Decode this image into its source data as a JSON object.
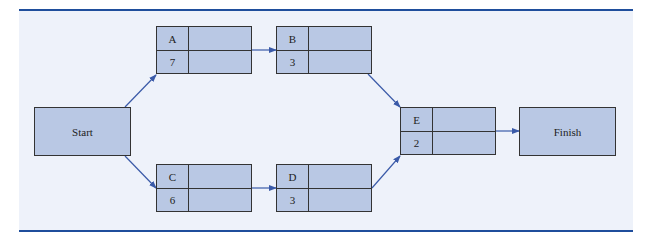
{
  "diagram": {
    "type": "activity-on-node network",
    "start_label": "Start",
    "finish_label": "Finish",
    "nodes": [
      {
        "id": "A",
        "duration": "7"
      },
      {
        "id": "B",
        "duration": "3"
      },
      {
        "id": "C",
        "duration": "6"
      },
      {
        "id": "D",
        "duration": "3"
      },
      {
        "id": "E",
        "duration": "2"
      }
    ],
    "edges": [
      [
        "Start",
        "A"
      ],
      [
        "Start",
        "C"
      ],
      [
        "A",
        "B"
      ],
      [
        "C",
        "D"
      ],
      [
        "B",
        "E"
      ],
      [
        "D",
        "E"
      ],
      [
        "E",
        "Finish"
      ]
    ],
    "colors": {
      "node_fill": "#b9c8e4",
      "border": "#333333",
      "arrow": "#3a5aa8",
      "rule": "#1f4e9c",
      "background": "#eef2fa"
    }
  }
}
